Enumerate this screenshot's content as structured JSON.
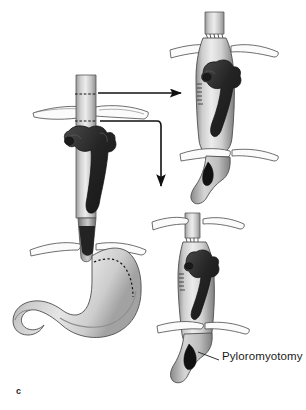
{
  "figure": {
    "panel_letter": "c",
    "background_color": "#ffffff",
    "width": 306,
    "height": 410
  },
  "labels": {
    "pyloromyotomy": "Pyloromyotomy"
  },
  "palette": {
    "ink": "#1a1a1a",
    "outline": "#3d3d3d",
    "tissue_light": "#e4e4e4",
    "tissue_mid": "#c2c2c2",
    "tissue_shadow": "#8e8e8e",
    "vessel_dark": "#2b2b2b",
    "lumen_black": "#111111",
    "crus_fill": "#fbfbfb",
    "arrow": "#111111"
  },
  "panels": [
    {
      "id": "panel-mobilized-esophagus",
      "name": "mobilized esophagus with vascular arch and crura",
      "position": "center-left-upper"
    },
    {
      "id": "panel-stomach",
      "name": "stomach with dotted gastric conduit resection line",
      "position": "bottom-left"
    },
    {
      "id": "panel-conduit-upper",
      "name": "gastric conduit pull-up with esophagogastric anastomosis",
      "position": "top-right"
    },
    {
      "id": "panel-conduit-lower",
      "name": "gastric conduit with pyloromyotomy",
      "position": "bottom-right"
    }
  ],
  "arrows": [
    {
      "id": "arrow-to-upper-right",
      "shape": "straight-horizontal",
      "direction": "right"
    },
    {
      "id": "arrow-to-lower-right",
      "shape": "elbow-right-then-down",
      "direction": "down"
    }
  ],
  "annotations": [
    {
      "id": "leader-pyloromyotomy",
      "type": "leader-line",
      "target": "pylorus-incision"
    }
  ]
}
